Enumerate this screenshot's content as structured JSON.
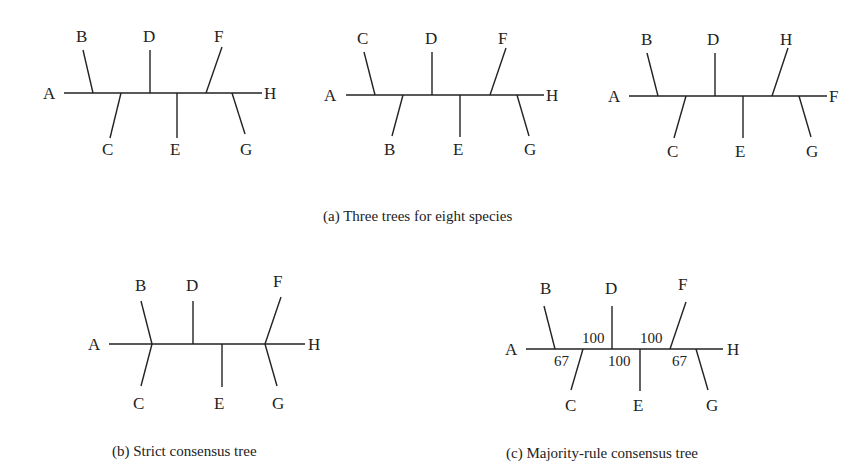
{
  "figure": {
    "caption_a": "(a) Three trees for eight species",
    "caption_b": "(b) Strict consensus tree",
    "caption_c": "(c) Majority-rule consensus tree",
    "tree1": {
      "left": "A",
      "right": "H",
      "top": [
        "B",
        "D",
        "F"
      ],
      "bottom": [
        "C",
        "E",
        "G"
      ]
    },
    "tree2": {
      "left": "A",
      "right": "H",
      "top": [
        "C",
        "D",
        "F"
      ],
      "bottom": [
        "B",
        "E",
        "G"
      ]
    },
    "tree3": {
      "left": "A",
      "right": "F",
      "top": [
        "B",
        "D",
        "H"
      ],
      "bottom": [
        "C",
        "E",
        "G"
      ]
    },
    "strict": {
      "left": "A",
      "right": "H",
      "top": [
        "B",
        "D",
        "F"
      ],
      "bottom": [
        "C",
        "E",
        "G"
      ]
    },
    "majority": {
      "left": "A",
      "right": "H",
      "top": [
        "B",
        "D",
        "F"
      ],
      "bottom": [
        "C",
        "E",
        "G"
      ],
      "support": [
        "67",
        "100",
        "100",
        "100",
        "67"
      ]
    }
  }
}
